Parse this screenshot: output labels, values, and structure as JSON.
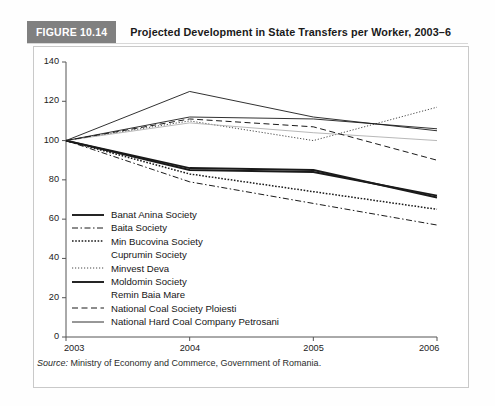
{
  "figure": {
    "badge": "FIGURE 10.14",
    "title": "Projected Development in State Transfers per Worker, 2003–6",
    "source_label": "Source:",
    "source_text": " Ministry of Economy and Commerce, Government of Romania."
  },
  "colors": {
    "badge_background": "#808080",
    "badge_text": "#ffffff",
    "title_text": "#1a1a1a",
    "box_border": "#c9c9c9",
    "axis": "#555555",
    "line": "#1a1a1a",
    "line_light": "#b0b0b0"
  },
  "chart_data": {
    "type": "line",
    "title": "Projected Development in State Transfers per Worker, 2003–6",
    "xlabel": "",
    "ylabel": "",
    "x": [
      "2003",
      "2004",
      "2005",
      "2006"
    ],
    "xtick_labels": [
      "2003",
      "2004",
      "2005",
      "2006"
    ],
    "ytick_labels": [
      "0",
      "20",
      "40",
      "60",
      "80",
      "100",
      "120",
      "140"
    ],
    "ytick_values": [
      0,
      20,
      40,
      60,
      80,
      100,
      120,
      140
    ],
    "ylim": [
      0,
      140
    ],
    "grid": false,
    "legend_position": "inside-lower-left",
    "series": [
      {
        "name": "Banat Anina Society",
        "style": "solid-thick",
        "values": [
          100,
          85,
          84,
          72
        ]
      },
      {
        "name": "Baita Society",
        "style": "dash-dot",
        "values": [
          100,
          79,
          68,
          57
        ]
      },
      {
        "name": "Min Bucovina Society",
        "style": "dotted-bold",
        "values": [
          100,
          83,
          74,
          65
        ]
      },
      {
        "name": "Cuprumin Society",
        "style": "solid-thin",
        "values": [
          100,
          125,
          112,
          105
        ]
      },
      {
        "name": "Minvest Deva",
        "style": "dotted-fine",
        "values": [
          100,
          110,
          100,
          117
        ]
      },
      {
        "name": "Moldomin Society",
        "style": "solid-thick",
        "values": [
          100,
          86,
          85,
          71
        ]
      },
      {
        "name": "Remin Baia Mare",
        "style": "solid-light",
        "values": [
          100,
          109,
          104,
          100
        ]
      },
      {
        "name": "National Coal Society Ploiesti",
        "style": "dashed",
        "values": [
          100,
          111,
          107,
          90
        ]
      },
      {
        "name": "National Hard Coal Company Petrosani",
        "style": "solid-thin",
        "values": [
          100,
          112,
          111,
          106
        ]
      }
    ]
  }
}
